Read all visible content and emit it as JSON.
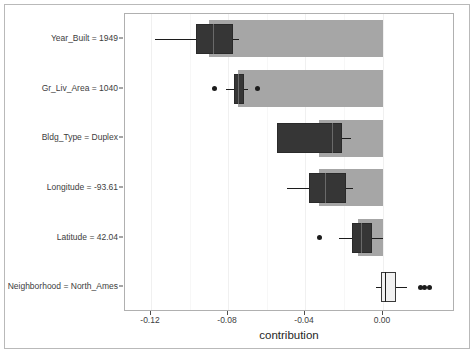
{
  "chart_data": {
    "type": "bar",
    "title": "",
    "subtitle": "",
    "xlabel": "contribution",
    "ylabel": "",
    "xlim": [
      -0.1335,
      0.0375
    ],
    "grid": true,
    "legend": null,
    "orientation": "horizontal",
    "xticks": [
      -0.12,
      -0.08,
      -0.04,
      0.0
    ],
    "xticklabels": [
      "-0.12",
      "-0.08",
      "-0.04",
      "0.00"
    ],
    "categories": [
      "Year_Built = 1949",
      "Gr_Liv_Area = 1040",
      "Bldg_Type = Duplex",
      "Longitude = -93.61",
      "Latitude = 42.04",
      "Neighborhood = North_Ames"
    ],
    "values": [
      -0.09,
      -0.0752,
      -0.0328,
      -0.0328,
      -0.0129,
      0.0
    ],
    "boxplots": [
      {
        "category": "Year_Built = 1949",
        "fill": "dark",
        "whisker_low": -0.1177,
        "q1": -0.0965,
        "median": -0.0877,
        "q3": -0.0775,
        "whisker_high": -0.0743,
        "outliers": []
      },
      {
        "category": "Gr_Liv_Area = 1040",
        "fill": "dark",
        "whisker_low": -0.0812,
        "q1": -0.0771,
        "median": -0.0747,
        "q3": -0.072,
        "whisker_high": -0.0697,
        "outliers": [
          -0.0872,
          -0.0651
        ]
      },
      {
        "category": "Bldg_Type = Duplex",
        "fill": "dark",
        "whisker_low": -0.0549,
        "q1": -0.0549,
        "median": -0.0263,
        "q3": -0.0208,
        "whisker_high": -0.0166,
        "outliers": []
      },
      {
        "category": "Longitude = -93.61",
        "fill": "dark",
        "whisker_low": -0.0498,
        "q1": -0.0383,
        "median": -0.03,
        "q3": -0.0189,
        "whisker_high": -0.0152,
        "outliers": []
      },
      {
        "category": "Latitude = 42.04",
        "fill": "dark",
        "whisker_low": -0.0226,
        "q1": -0.0161,
        "median": -0.011,
        "q3": -0.0055,
        "whisker_high": 0.0,
        "outliers": [
          -0.0328
        ]
      },
      {
        "category": "Neighborhood = North_Ames",
        "fill": "light",
        "whisker_low": -0.0032,
        "q1": -0.0009,
        "median": 0.0014,
        "q3": 0.0069,
        "whisker_high": 0.0125,
        "outliers": [
          0.0194,
          0.0217,
          0.0245
        ]
      }
    ],
    "colors": {
      "bar": "#a6a6a6",
      "box_dark": "#363636",
      "box_light": "#f2f2f2",
      "line": "#1c1c1c",
      "panel_border": "#b0b0b0",
      "grid_major": "#f0f0f0",
      "text": "#3d3d3d"
    }
  }
}
